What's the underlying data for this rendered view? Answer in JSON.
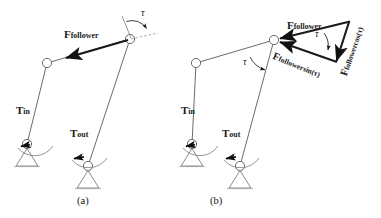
{
  "figure": {
    "background_color": "#ffffff",
    "line_color": "#6b6b6b",
    "force_color": "#111111"
  },
  "panels": [
    {
      "id": "a",
      "caption": "(a)",
      "labels": {
        "force_follower": "F",
        "force_follower_sub": "follower",
        "torque_in": "T",
        "torque_in_sub": "in",
        "torque_out": "T",
        "torque_out_sub": "out",
        "angle": "τ"
      }
    },
    {
      "id": "b",
      "caption": "(b)",
      "labels": {
        "force_follower": "F",
        "force_follower_sub": "follower",
        "torque_in": "T",
        "torque_in_sub": "in",
        "torque_out": "T",
        "torque_out_sub": "out",
        "angle_joint": "τ",
        "angle_triangle": "τ",
        "component_sin": "F",
        "component_sin_sub": "follower",
        "component_sin_fn": "sin(τ)",
        "component_cos": "F",
        "component_cos_sub": "follower",
        "component_cos_fn": "cos(τ)"
      }
    }
  ]
}
